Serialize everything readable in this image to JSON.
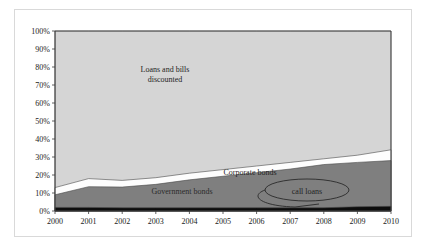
{
  "chart_data": {
    "type": "area",
    "title": "",
    "subtitle": "",
    "xlabel": "",
    "ylabel": "",
    "stacked": true,
    "stack_order": [
      "call loans",
      "Government bonds",
      "Corporate bonds",
      "Loans and bills discounted"
    ],
    "grid": false,
    "legend_position": "none (in-plot annotations)",
    "xlim": [
      2000,
      2010
    ],
    "ylim": [
      0,
      100
    ],
    "x": [
      2000,
      2001,
      2002,
      2003,
      2004,
      2005,
      2006,
      2007,
      2008,
      2009,
      2010
    ],
    "categories": [
      "2000",
      "2001",
      "2002",
      "2003",
      "2004",
      "2005",
      "2006",
      "2007",
      "2008",
      "2009",
      "2010"
    ],
    "xtick_labels": [
      "2000",
      "2001",
      "2002",
      "2003",
      "2004",
      "2005",
      "2006",
      "2007",
      "2008",
      "2009",
      "2010"
    ],
    "ytick_labels": [
      "0%",
      "10%",
      "20%",
      "30%",
      "40%",
      "50%",
      "60%",
      "70%",
      "80%",
      "90%",
      "100%"
    ],
    "ytick_values": [
      0,
      10,
      20,
      30,
      40,
      50,
      60,
      70,
      80,
      90,
      100
    ],
    "series": [
      {
        "name": "call loans",
        "color": "#0d0d0d",
        "values": [
          2.0,
          2.0,
          1.8,
          1.8,
          1.8,
          1.8,
          1.8,
          1.8,
          1.8,
          2.4,
          2.6
        ]
      },
      {
        "name": "Government bonds",
        "color": "#7f7f7f",
        "values": [
          7.0,
          11.5,
          11.5,
          13.0,
          15.5,
          17.5,
          19.5,
          21.5,
          24.0,
          24.6,
          25.4
        ]
      },
      {
        "name": "Corporate bonds",
        "color": "#fdfdfd",
        "values": [
          4.0,
          4.5,
          3.7,
          3.7,
          3.7,
          3.7,
          3.7,
          3.7,
          3.2,
          4.0,
          6.0
        ]
      },
      {
        "name": "Loans and bills discounted",
        "color": "#d5d5d5",
        "values": [
          87.0,
          82.0,
          83.0,
          81.5,
          79.0,
          77.0,
          75.0,
          73.0,
          71.0,
          69.0,
          66.0
        ]
      }
    ],
    "cumulative_tops": {
      "call loans": [
        2.0,
        2.0,
        1.8,
        1.8,
        1.8,
        1.8,
        1.8,
        1.8,
        1.8,
        2.4,
        2.6
      ],
      "Government bonds": [
        9.0,
        13.5,
        13.3,
        14.8,
        17.3,
        19.3,
        21.3,
        23.3,
        25.8,
        27.0,
        28.0
      ],
      "Corporate bonds": [
        13.0,
        18.0,
        17.0,
        18.5,
        21.0,
        23.0,
        25.0,
        27.0,
        29.0,
        31.0,
        34.0
      ],
      "Loans and bills discounted": [
        100,
        100,
        100,
        100,
        100,
        100,
        100,
        100,
        100,
        100,
        100
      ]
    },
    "annotations": [
      {
        "name": "loans-and-bills-label",
        "text_lines": [
          "Loans and bills",
          "discounted"
        ],
        "x_px": 165,
        "y_px": 72
      },
      {
        "name": "corporate-bonds-label",
        "text": "Corporate  bonds",
        "x_px": 250,
        "y_px": 173
      },
      {
        "name": "government-bonds-label",
        "text": "Government bonds",
        "x_px": 182,
        "y_px": 192
      },
      {
        "name": "call-loans-label",
        "text": "call loans",
        "x_px": 307,
        "y_px": 192,
        "has_ellipse": true,
        "has_leader_line": true
      }
    ]
  },
  "plot_geometry": {
    "left_px": 55,
    "right_px": 391,
    "top_px": 31,
    "bottom_px": 211
  },
  "colors": {
    "plot_background": "#d5d5d5",
    "loans_and_bills": "#d5d5d5",
    "corporate_bonds": "#fdfdfd",
    "government_bonds": "#7f7f7f",
    "call_loans": "#0d0d0d",
    "axis": "#3a3a3a",
    "text": "#1a1a1a",
    "page_background": "#ffffff",
    "frame_border": "#d9d9d9"
  }
}
